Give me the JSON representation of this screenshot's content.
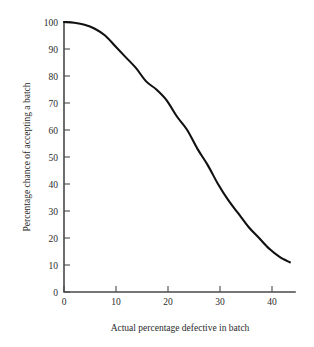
{
  "chart_data": {
    "type": "line",
    "title": "",
    "subtitle": "",
    "xlabel": "Actual percentage defective in batch",
    "ylabel": "Percentage chance of accepting a batch",
    "xlim": [
      0,
      45
    ],
    "ylim": [
      0,
      100
    ],
    "xticks": [
      0,
      10,
      20,
      30,
      40
    ],
    "yticks": [
      0,
      10,
      20,
      30,
      40,
      50,
      60,
      70,
      80,
      90,
      100
    ],
    "xtick_labels": [
      "0",
      "10",
      "20",
      "30",
      "40"
    ],
    "ytick_labels": [
      "0",
      "10",
      "20",
      "30",
      "40",
      "50",
      "60",
      "70",
      "80",
      "90",
      "100"
    ],
    "grid": false,
    "legend": false,
    "legend_position": "none",
    "line_color": "#111111",
    "axis_color": "#4a4a4a",
    "background_color": "#ffffff",
    "x": [
      0,
      2,
      4,
      6,
      8,
      10,
      12,
      14,
      16,
      18,
      20,
      22,
      24,
      26,
      28,
      30,
      32,
      34,
      36,
      38,
      40,
      42,
      44
    ],
    "series": [
      {
        "name": "Operating characteristic",
        "values": [
          100,
          99.7,
          99,
          97.5,
          95,
          91,
          87,
          83,
          78,
          75,
          71,
          65,
          60,
          53,
          47,
          40,
          34,
          29,
          24,
          20,
          16,
          13,
          11
        ]
      }
    ]
  },
  "axes": {
    "x_axis_label": "Actual percentage defective in batch",
    "y_axis_label": "Percentage chance of accepting a batch"
  }
}
